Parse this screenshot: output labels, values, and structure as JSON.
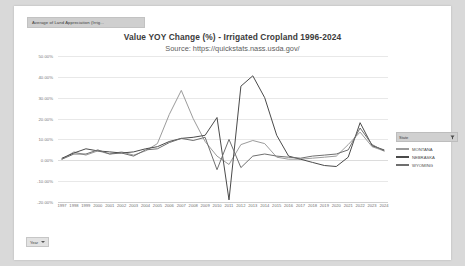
{
  "window": {
    "background": "#d9d9d9",
    "page_background": "#ffffff"
  },
  "sheet_tab": {
    "label": "Average of Land Appreciation (Irrig..."
  },
  "legend": {
    "header_label": "State",
    "filter_icon": "funnel-icon",
    "caret_icon": "chevron-down-icon",
    "entries": [
      {
        "label": "MONTANA",
        "color": "#9b9b9b"
      },
      {
        "label": "NEBRASKA",
        "color": "#4a4a4a"
      },
      {
        "label": "WYOMING",
        "color": "#6f6f6f"
      }
    ]
  },
  "year_filter": {
    "label": "Year",
    "caret_icon": "chevron-down-icon"
  },
  "chart_data": {
    "type": "line",
    "title": "Value YOY Change (%)  - Irrigated Cropland  1996-2024",
    "subtitle": "Source: https://quickstats.nass.usda.gov/",
    "xlabel": "",
    "ylabel": "",
    "ylim": [
      -20,
      50
    ],
    "ytick_values": [
      50,
      40,
      30,
      20,
      10,
      0,
      -10,
      -20
    ],
    "ytick_labels": [
      "50.00%",
      "40.00%",
      "30.00%",
      "20.00%",
      "10.00%",
      "0.00%",
      "-10.00%",
      "-20.00%"
    ],
    "grid": true,
    "legend_position": "right",
    "x": [
      1997,
      1998,
      1999,
      2000,
      2001,
      2002,
      2003,
      2004,
      2005,
      2006,
      2007,
      2008,
      2009,
      2010,
      2011,
      2012,
      2013,
      2014,
      2015,
      2016,
      2017,
      2018,
      2019,
      2020,
      2021,
      2022,
      2023,
      2024
    ],
    "categories": [
      "1997",
      "1998",
      "1999",
      "2000",
      "2001",
      "2002",
      "2003",
      "2004",
      "2005",
      "2006",
      "2007",
      "2008",
      "2009",
      "2010",
      "2011",
      "2012",
      "2013",
      "2014",
      "2015",
      "2016",
      "2017",
      "2018",
      "2019",
      "2020",
      "2021",
      "2022",
      "2023",
      "2024"
    ],
    "series": [
      {
        "name": "MONTANA",
        "color": "#9b9b9b",
        "values": [
          0.5,
          4.0,
          2.5,
          4.5,
          3.0,
          4.0,
          2.5,
          4.5,
          8.0,
          22.0,
          33.5,
          20.0,
          9.0,
          2.0,
          -2.0,
          7.5,
          9.5,
          8.0,
          1.5,
          0.5,
          0.5,
          1.0,
          1.5,
          2.0,
          7.5,
          13.5,
          6.5,
          4.5
        ]
      },
      {
        "name": "NEBRASKA",
        "color": "#4a4a4a",
        "values": [
          1.0,
          3.5,
          5.5,
          4.5,
          4.0,
          3.5,
          4.0,
          5.5,
          6.5,
          9.0,
          10.5,
          11.0,
          12.0,
          20.5,
          -19.0,
          35.5,
          40.5,
          30.0,
          12.0,
          2.0,
          0.5,
          -1.0,
          -2.5,
          -3.0,
          1.5,
          18.0,
          7.0,
          5.0
        ]
      },
      {
        "name": "WYOMING",
        "color": "#6f6f6f",
        "values": [
          0.5,
          3.0,
          3.0,
          5.0,
          3.0,
          3.5,
          2.0,
          5.0,
          5.5,
          8.5,
          10.5,
          9.5,
          11.0,
          -4.5,
          10.0,
          -3.5,
          2.0,
          3.0,
          2.0,
          1.5,
          1.0,
          2.0,
          2.5,
          3.0,
          5.0,
          15.5,
          7.5,
          4.5
        ]
      }
    ]
  }
}
